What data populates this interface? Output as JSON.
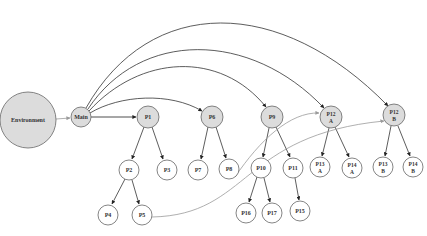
{
  "diagram": {
    "colors": {
      "filled_node": "#dcdcdc",
      "empty_node": "#ffffff",
      "stroke": "#555555",
      "edge": "#333333",
      "light_edge": "#9a9a9a"
    },
    "nodes": {
      "environment": {
        "label": "Environment",
        "x": 28,
        "y": 120,
        "r": 28,
        "filled": true
      },
      "main": {
        "label": "Main",
        "x": 81,
        "y": 117,
        "r": 10,
        "filled": true
      },
      "p1": {
        "label": "P1",
        "x": 148,
        "y": 117,
        "r": 11,
        "filled": true
      },
      "p6": {
        "label": "P6",
        "x": 212,
        "y": 117,
        "r": 11,
        "filled": true
      },
      "p9": {
        "label": "P9",
        "x": 272,
        "y": 117,
        "r": 11,
        "filled": true
      },
      "p12a": {
        "label_line1": "P12",
        "label_line2": "A",
        "x": 331,
        "y": 117,
        "r": 11,
        "filled": true
      },
      "p12b": {
        "label_line1": "P12",
        "label_line2": "B",
        "x": 394,
        "y": 115,
        "r": 11,
        "filled": true
      },
      "p2": {
        "label": "P2",
        "x": 129,
        "y": 170,
        "r": 10
      },
      "p3": {
        "label": "P3",
        "x": 167,
        "y": 170,
        "r": 10
      },
      "p7": {
        "label": "P7",
        "x": 198,
        "y": 170,
        "r": 10
      },
      "p8": {
        "label": "P8",
        "x": 229,
        "y": 169,
        "r": 10
      },
      "p10": {
        "label": "P10",
        "x": 261,
        "y": 168,
        "r": 10
      },
      "p11": {
        "label": "P11",
        "x": 293,
        "y": 168,
        "r": 10
      },
      "p13a": {
        "label_line1": "P13",
        "label_line2": "A",
        "x": 320,
        "y": 167,
        "r": 10
      },
      "p14a": {
        "label_line1": "P14",
        "label_line2": "A",
        "x": 352,
        "y": 168,
        "r": 10
      },
      "p13b": {
        "label_line1": "P13",
        "label_line2": "B",
        "x": 383,
        "y": 167,
        "r": 10
      },
      "p14b": {
        "label_line1": "P14",
        "label_line2": "B",
        "x": 413,
        "y": 167,
        "r": 10
      },
      "p4": {
        "label": "P4",
        "x": 108,
        "y": 215,
        "r": 10
      },
      "p5": {
        "label": "P5",
        "x": 142,
        "y": 215,
        "r": 10
      },
      "p16": {
        "label": "P16",
        "x": 246,
        "y": 213,
        "r": 10
      },
      "p17": {
        "label": "P17",
        "x": 272,
        "y": 213,
        "r": 10
      },
      "p15": {
        "label": "P15",
        "x": 300,
        "y": 211,
        "r": 10
      }
    },
    "edges": [
      {
        "from": "Environment",
        "to": "Main",
        "style": "light"
      },
      {
        "from": "Main",
        "to": "P1"
      },
      {
        "from": "Main",
        "to": "P6"
      },
      {
        "from": "Main",
        "to": "P9"
      },
      {
        "from": "Main",
        "to": "P12 A"
      },
      {
        "from": "Main",
        "to": "P12 B"
      },
      {
        "from": "P1",
        "to": "P2"
      },
      {
        "from": "P1",
        "to": "P3"
      },
      {
        "from": "P2",
        "to": "P4"
      },
      {
        "from": "P2",
        "to": "P5"
      },
      {
        "from": "P6",
        "to": "P7"
      },
      {
        "from": "P6",
        "to": "P8"
      },
      {
        "from": "P9",
        "to": "P10"
      },
      {
        "from": "P9",
        "to": "P11"
      },
      {
        "from": "P10",
        "to": "P16"
      },
      {
        "from": "P10",
        "to": "P17"
      },
      {
        "from": "P11",
        "to": "P15"
      },
      {
        "from": "P12 A",
        "to": "P13 A"
      },
      {
        "from": "P12 A",
        "to": "P14 A"
      },
      {
        "from": "P12 B",
        "to": "P13 B"
      },
      {
        "from": "P12 B",
        "to": "P14 B"
      },
      {
        "from": "P8",
        "to": "P12 A",
        "style": "light"
      },
      {
        "from": "P5",
        "to": "P12 B",
        "style": "light"
      }
    ]
  }
}
